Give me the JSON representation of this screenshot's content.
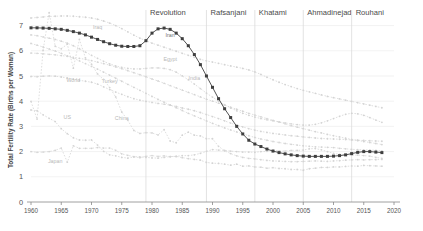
{
  "chart_data": {
    "type": "line",
    "title": "",
    "xlabel": "",
    "ylabel": "Total Fertility Rate (Births per Woman)",
    "xlim": [
      1960,
      2020
    ],
    "ylim": [
      0,
      7.3
    ],
    "xticks": [
      1960,
      1965,
      1970,
      1975,
      1980,
      1985,
      1990,
      1995,
      2000,
      2005,
      2010,
      2015,
      2020
    ],
    "yticks": [
      0,
      1,
      2,
      3,
      4,
      5,
      6,
      7
    ],
    "grid": true,
    "legend_position": "inline-annotations",
    "annotations": [
      {
        "label": "Revolution",
        "x": 1979
      },
      {
        "label": "Rafsanjani",
        "x": 1989
      },
      {
        "label": "Khatami",
        "x": 1997
      },
      {
        "label": "Ahmadinejad",
        "x": 2005
      },
      {
        "label": "Rouhani",
        "x": 2013
      }
    ],
    "highlight_color": "#3f3f3f",
    "background_series_color": "#d4d4d4",
    "x": [
      1960,
      1961,
      1962,
      1963,
      1964,
      1965,
      1966,
      1967,
      1968,
      1969,
      1970,
      1971,
      1972,
      1973,
      1974,
      1975,
      1976,
      1977,
      1978,
      1979,
      1980,
      1981,
      1982,
      1983,
      1984,
      1985,
      1986,
      1987,
      1988,
      1989,
      1990,
      1991,
      1992,
      1993,
      1994,
      1995,
      1996,
      1997,
      1998,
      1999,
      2000,
      2001,
      2002,
      2003,
      2004,
      2005,
      2006,
      2007,
      2008,
      2009,
      2010,
      2011,
      2012,
      2013,
      2014,
      2015,
      2016,
      2017,
      2018
    ],
    "series": [
      {
        "name": "Iran",
        "highlight": true,
        "label_x": 1983,
        "label_y": 6.55,
        "values": [
          6.91,
          6.91,
          6.9,
          6.89,
          6.87,
          6.85,
          6.81,
          6.76,
          6.7,
          6.63,
          6.54,
          6.45,
          6.36,
          6.28,
          6.22,
          6.18,
          6.17,
          6.17,
          6.2,
          6.4,
          6.7,
          6.87,
          6.9,
          6.85,
          6.7,
          6.48,
          6.2,
          5.85,
          5.45,
          5.0,
          4.55,
          4.1,
          3.7,
          3.35,
          3.0,
          2.7,
          2.45,
          2.3,
          2.2,
          2.1,
          2.02,
          1.96,
          1.91,
          1.87,
          1.84,
          1.82,
          1.81,
          1.81,
          1.81,
          1.81,
          1.82,
          1.84,
          1.87,
          1.92,
          1.97,
          2.0,
          2.0,
          1.98,
          1.96
        ]
      },
      {
        "name": "Iraq",
        "highlight": false,
        "label_x": 1971,
        "label_y": 6.85,
        "values": [
          7.3,
          7.32,
          7.34,
          7.36,
          7.37,
          7.38,
          7.38,
          7.37,
          7.35,
          7.33,
          7.3,
          7.25,
          7.18,
          7.1,
          7.0,
          6.88,
          6.75,
          6.62,
          6.5,
          6.4,
          6.3,
          6.22,
          6.14,
          6.06,
          5.98,
          5.9,
          5.82,
          5.74,
          5.66,
          5.6,
          5.55,
          5.5,
          5.45,
          5.4,
          5.35,
          5.3,
          5.24,
          5.16,
          5.06,
          4.95,
          4.85,
          4.75,
          4.66,
          4.58,
          4.5,
          4.43,
          4.37,
          4.31,
          4.25,
          4.19,
          4.14,
          4.09,
          4.04,
          3.99,
          3.94,
          3.89,
          3.84,
          3.79,
          3.74
        ]
      },
      {
        "name": "Egypt",
        "highlight": false,
        "label_x": 1983,
        "label_y": 5.6,
        "values": [
          6.63,
          6.6,
          6.55,
          6.5,
          6.45,
          6.38,
          6.3,
          6.2,
          6.08,
          5.95,
          5.82,
          5.7,
          5.58,
          5.48,
          5.4,
          5.34,
          5.3,
          5.28,
          5.28,
          5.3,
          5.32,
          5.32,
          5.3,
          5.25,
          5.15,
          5.0,
          4.85,
          4.68,
          4.5,
          4.32,
          4.16,
          4.0,
          3.86,
          3.73,
          3.62,
          3.52,
          3.44,
          3.37,
          3.31,
          3.26,
          3.22,
          3.18,
          3.14,
          3.1,
          3.07,
          3.05,
          3.05,
          3.08,
          3.14,
          3.22,
          3.31,
          3.4,
          3.48,
          3.52,
          3.5,
          3.44,
          3.35,
          3.25,
          3.16
        ]
      },
      {
        "name": "India",
        "highlight": false,
        "label_x": 1987,
        "label_y": 4.85,
        "values": [
          5.91,
          5.9,
          5.88,
          5.86,
          5.84,
          5.81,
          5.78,
          5.74,
          5.7,
          5.66,
          5.61,
          5.55,
          5.49,
          5.43,
          5.36,
          5.29,
          5.21,
          5.13,
          5.05,
          4.97,
          4.88,
          4.8,
          4.71,
          4.62,
          4.53,
          4.44,
          4.35,
          4.26,
          4.17,
          4.08,
          4.0,
          3.92,
          3.84,
          3.76,
          3.68,
          3.6,
          3.52,
          3.45,
          3.38,
          3.31,
          3.24,
          3.17,
          3.1,
          3.03,
          2.97,
          2.91,
          2.85,
          2.79,
          2.74,
          2.68,
          2.63,
          2.58,
          2.53,
          2.48,
          2.44,
          2.4,
          2.36,
          2.32,
          2.28
        ]
      },
      {
        "name": "Turkey",
        "highlight": false,
        "label_x": 1973,
        "label_y": 4.72,
        "values": [
          6.29,
          6.22,
          6.15,
          6.07,
          5.99,
          5.9,
          5.8,
          5.7,
          5.6,
          5.49,
          5.38,
          5.27,
          5.15,
          5.03,
          4.91,
          4.79,
          4.67,
          4.55,
          4.43,
          4.31,
          4.19,
          4.07,
          3.96,
          3.85,
          3.74,
          3.63,
          3.52,
          3.42,
          3.32,
          3.22,
          3.12,
          3.03,
          2.94,
          2.86,
          2.78,
          2.7,
          2.63,
          2.56,
          2.5,
          2.45,
          2.4,
          2.36,
          2.32,
          2.29,
          2.26,
          2.23,
          2.21,
          2.19,
          2.18,
          2.17,
          2.16,
          2.13,
          2.11,
          2.09,
          2.08,
          2.07,
          2.06,
          2.05,
          2.03
        ]
      },
      {
        "name": "World",
        "highlight": false,
        "label_x": 1967,
        "label_y": 4.78,
        "values": [
          4.98,
          4.97,
          4.99,
          5.0,
          4.99,
          4.96,
          4.92,
          4.88,
          4.83,
          4.79,
          4.75,
          4.68,
          4.57,
          4.46,
          4.36,
          4.27,
          4.18,
          4.1,
          4.04,
          3.99,
          3.95,
          3.91,
          3.88,
          3.84,
          3.79,
          3.73,
          3.68,
          3.62,
          3.55,
          3.47,
          3.39,
          3.31,
          3.22,
          3.13,
          3.05,
          2.98,
          2.91,
          2.85,
          2.8,
          2.76,
          2.72,
          2.69,
          2.66,
          2.63,
          2.61,
          2.58,
          2.56,
          2.54,
          2.52,
          2.51,
          2.5,
          2.49,
          2.48,
          2.46,
          2.45,
          2.44,
          2.43,
          2.42,
          2.41
        ]
      },
      {
        "name": "China",
        "highlight": false,
        "label_x": 1975,
        "label_y": 3.25,
        "values": [
          3.99,
          3.29,
          6.02,
          7.51,
          6.18,
          6.08,
          6.26,
          5.31,
          6.45,
          5.72,
          5.47,
          5.08,
          4.86,
          4.54,
          4.17,
          3.57,
          3.24,
          2.84,
          2.72,
          2.75,
          2.74,
          2.66,
          2.87,
          2.42,
          2.35,
          2.65,
          2.77,
          2.65,
          2.62,
          2.51,
          2.51,
          2.21,
          2.03,
          1.92,
          1.83,
          1.77,
          1.73,
          1.71,
          1.68,
          1.65,
          1.63,
          1.62,
          1.61,
          1.6,
          1.6,
          1.61,
          1.62,
          1.63,
          1.62,
          1.61,
          1.63,
          1.64,
          1.66,
          1.67,
          1.68,
          1.67,
          1.68,
          1.68,
          1.69
        ]
      },
      {
        "name": "US",
        "highlight": false,
        "label_x": 1966,
        "label_y": 3.28,
        "values": [
          3.65,
          3.62,
          3.46,
          3.32,
          3.19,
          2.91,
          2.71,
          2.55,
          2.46,
          2.45,
          2.46,
          2.26,
          2.01,
          1.87,
          1.83,
          1.77,
          1.74,
          1.79,
          1.76,
          1.81,
          1.84,
          1.81,
          1.83,
          1.8,
          1.81,
          1.84,
          1.84,
          1.87,
          1.93,
          2.01,
          2.08,
          2.06,
          2.05,
          2.02,
          2.0,
          1.98,
          1.98,
          1.97,
          2.0,
          2.01,
          2.06,
          2.03,
          2.02,
          2.05,
          2.05,
          2.06,
          2.11,
          2.12,
          2.07,
          2.0,
          1.93,
          1.89,
          1.88,
          1.86,
          1.86,
          1.84,
          1.82,
          1.77,
          1.73
        ]
      },
      {
        "name": "Japan",
        "highlight": false,
        "label_x": 1964,
        "label_y": 1.55,
        "values": [
          2.0,
          1.97,
          1.98,
          2.0,
          2.05,
          2.14,
          1.58,
          2.23,
          2.13,
          2.13,
          2.13,
          2.16,
          2.14,
          2.14,
          2.05,
          1.91,
          1.85,
          1.8,
          1.79,
          1.77,
          1.75,
          1.74,
          1.77,
          1.8,
          1.81,
          1.76,
          1.72,
          1.69,
          1.66,
          1.57,
          1.54,
          1.53,
          1.5,
          1.46,
          1.5,
          1.42,
          1.43,
          1.39,
          1.38,
          1.34,
          1.36,
          1.33,
          1.32,
          1.29,
          1.29,
          1.26,
          1.32,
          1.34,
          1.37,
          1.37,
          1.39,
          1.39,
          1.41,
          1.43,
          1.42,
          1.45,
          1.44,
          1.43,
          1.42
        ]
      }
    ]
  }
}
